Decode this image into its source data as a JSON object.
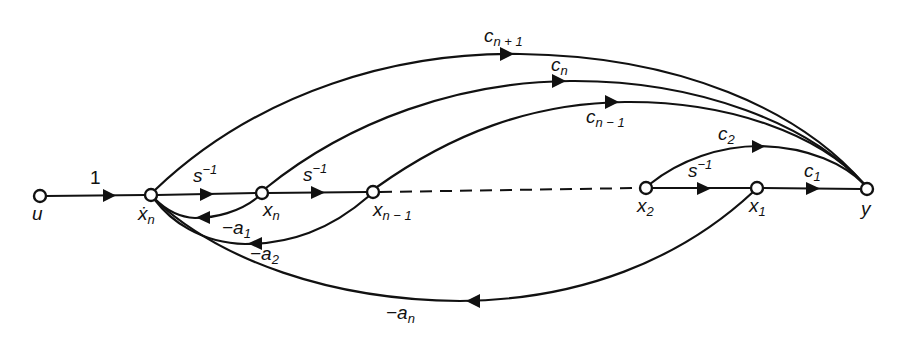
{
  "diagram": {
    "nodes": [
      {
        "id": "u",
        "label": "u",
        "x": 40,
        "y": 196
      },
      {
        "id": "xdot_n",
        "label": "ẋ",
        "sub": "n",
        "x": 151,
        "y": 195
      },
      {
        "id": "x_n",
        "label": "x",
        "sub": "n",
        "x": 262,
        "y": 193
      },
      {
        "id": "x_n-1",
        "label": "x",
        "sub": "n − 1",
        "x": 373,
        "y": 192
      },
      {
        "id": "x_2",
        "label": "x",
        "sub": "2",
        "x": 646,
        "y": 188
      },
      {
        "id": "x_1",
        "label": "x",
        "sub": "1",
        "x": 757,
        "y": 188
      },
      {
        "id": "y",
        "label": "y",
        "x": 867,
        "y": 189
      }
    ],
    "edges": [
      {
        "from": "u",
        "to": "xdot_n",
        "gain": "1"
      },
      {
        "from": "xdot_n",
        "to": "x_n",
        "gain": "s",
        "gain_sup": "−1"
      },
      {
        "from": "x_n",
        "to": "x_n-1",
        "gain": "s",
        "gain_sup": "−1"
      },
      {
        "from": "x_n-1",
        "to": "x_2",
        "gain": "",
        "style": "dashed"
      },
      {
        "from": "x_2",
        "to": "x_1",
        "gain": "s",
        "gain_sup": "−1"
      },
      {
        "from": "x_1",
        "to": "y",
        "gain": "c",
        "gain_sub": "1"
      },
      {
        "from": "x_2",
        "to": "y",
        "gain": "c",
        "gain_sub": "2"
      },
      {
        "from": "x_n-1",
        "to": "y",
        "gain": "c",
        "gain_sub": "n − 1"
      },
      {
        "from": "x_n",
        "to": "y",
        "gain": "c",
        "gain_sub": "n"
      },
      {
        "from": "xdot_n",
        "to": "y",
        "gain": "c",
        "gain_sub": "n + 1"
      },
      {
        "from": "x_n",
        "to": "xdot_n",
        "gain": "−a",
        "gain_sub": "1"
      },
      {
        "from": "x_n-1",
        "to": "xdot_n",
        "gain": "−a",
        "gain_sub": "2"
      },
      {
        "from": "x_1",
        "to": "xdot_n",
        "gain": "−a",
        "gain_sub": "n"
      }
    ]
  }
}
